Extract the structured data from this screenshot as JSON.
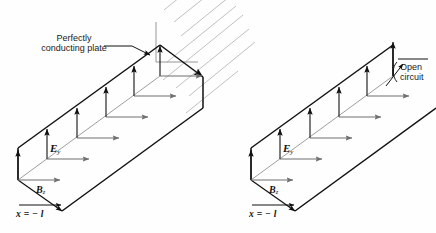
{
  "figure": {
    "type": "physics-field-diagram",
    "background_color": "#fefefe",
    "ink_color": "#111111",
    "gray_color": "#8d8d8d",
    "hatch_color": "#b9b9b9",
    "panels": [
      {
        "id": "left",
        "name": "shorted-line-panel",
        "termination": "perfectly-conducting-plate",
        "callout": "Perfectly\nconducting plate",
        "field_labels": {
          "electric": "E",
          "electric_sub": "y",
          "magnetic": "B",
          "magnetic_sub": "z"
        },
        "boundary_label": "x = − l",
        "arrow_pairs": 6,
        "hatch_lines": 7
      },
      {
        "id": "right",
        "name": "open-circuit-line-panel",
        "termination": "open-circuit",
        "callout": "Open\ncircuit",
        "field_labels": {
          "electric": "E",
          "electric_sub": "y",
          "magnetic": "B",
          "magnetic_sub": "z"
        },
        "boundary_label": "x = − l",
        "arrow_pairs": 6,
        "hatch_lines": 0
      }
    ]
  },
  "labels": {
    "plate_line1": "Perfectly",
    "plate_line2": "conducting plate",
    "open_line1": "Open",
    "open_line2": "circuit",
    "e_left_sym": "E",
    "e_left_sub": "y",
    "b_left_sym": "B",
    "b_left_sub": "z",
    "x_left": "x = − l",
    "e_right_sym": "E",
    "e_right_sub": "y",
    "b_right_sym": "B",
    "b_right_sub": "z",
    "x_right": "x = − l"
  }
}
